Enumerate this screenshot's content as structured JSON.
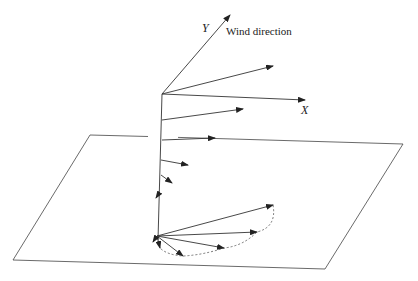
{
  "diagram": {
    "labels": {
      "y_axis": "Y",
      "x_axis": "X",
      "wind": "Wind direction"
    },
    "colors": {
      "line": "#333333",
      "dashed": "#555555",
      "background": "#ffffff"
    },
    "axis_origin": [
      162,
      94
    ],
    "vertical_axis": {
      "from": [
        162,
        94
      ],
      "to": [
        158,
        240
      ]
    },
    "axes": [
      {
        "name": "y-axis",
        "from": [
          162,
          94
        ],
        "to": [
          230,
          15
        ]
      },
      {
        "name": "x-axis",
        "from": [
          162,
          94
        ],
        "to": [
          305,
          100
        ]
      }
    ],
    "depth_vectors": [
      {
        "from": [
          162,
          94
        ],
        "to": [
          273,
          66
        ]
      },
      {
        "from": [
          162,
          120
        ],
        "to": [
          243,
          109
        ]
      },
      {
        "from": [
          162,
          140
        ],
        "to": [
          215,
          138
        ]
      },
      {
        "from": [
          161,
          160
        ],
        "to": [
          188,
          165
        ]
      },
      {
        "from": [
          161,
          175
        ],
        "to": [
          172,
          183
        ]
      },
      {
        "from": [
          160,
          192
        ],
        "to": [
          156,
          198
        ]
      }
    ],
    "plane": {
      "points": [
        [
          90,
          135
        ],
        [
          403,
          144
        ],
        [
          325,
          269
        ],
        [
          13,
          260
        ]
      ],
      "top_edge_gap": [
        148,
        178
      ]
    },
    "hodograph": {
      "origin": [
        157,
        236
      ],
      "vectors": [
        [
          273,
          205
        ],
        [
          257,
          232
        ],
        [
          224,
          248
        ],
        [
          183,
          256
        ],
        [
          160,
          248
        ],
        [
          153,
          240
        ]
      ],
      "dashed_curve": "M273,205 Q276,228 257,232 Q244,246 224,248 Q203,254 183,256 Q168,254 160,248"
    }
  }
}
